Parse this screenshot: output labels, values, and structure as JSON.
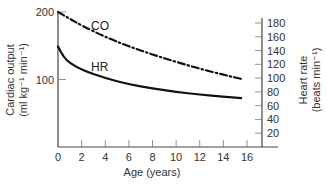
{
  "chart_data": {
    "type": "line",
    "title": "",
    "xlabel": "Age (years)",
    "ylabel_left": "Cardiac output (ml kg⁻¹ min⁻¹)",
    "ylabel_left_line1": "Cardiac output",
    "ylabel_left_line2": "(ml kg⁻¹ min⁻¹)",
    "ylabel_right": "Heart rate (beats min⁻¹)",
    "ylabel_right_line1": "Heart rate",
    "ylabel_right_line2": "(beats min⁻¹)",
    "xlim": [
      0,
      17
    ],
    "ylim_left": [
      0,
      200
    ],
    "ylim_right": [
      0,
      200
    ],
    "x_ticks": [
      0,
      2,
      4,
      6,
      8,
      10,
      12,
      14,
      16
    ],
    "y_left_ticks": [
      100,
      200
    ],
    "y_right_ticks": [
      20,
      40,
      60,
      80,
      100,
      120,
      140,
      160,
      180
    ],
    "grid": false,
    "legend": "inline labels",
    "series": [
      {
        "name": "CO",
        "axis": "left",
        "style": "dash-dot",
        "x": [
          0,
          1,
          2,
          4,
          6,
          8,
          10,
          12,
          14,
          15.5
        ],
        "values": [
          200,
          190,
          180,
          163,
          149,
          137,
          126,
          116,
          107,
          101
        ]
      },
      {
        "name": "HR",
        "axis": "right",
        "style": "solid",
        "x": [
          0,
          0.5,
          1,
          2,
          4,
          6,
          8,
          10,
          12,
          14,
          15.5
        ],
        "values": [
          146,
          130,
          122,
          112,
          100,
          91,
          85,
          80,
          76,
          73,
          71
        ]
      }
    ]
  }
}
